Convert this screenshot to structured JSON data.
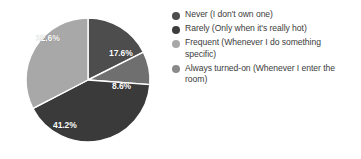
{
  "chart_data": {
    "type": "pie",
    "title": "",
    "legend_position": "right",
    "categories": [
      "Never (I don't own one)",
      "Rarely (Only when it's really hot)",
      "Frequent (Whenever I do something specific)",
      "Always turned-on (Whenever I enter the room)"
    ],
    "values": [
      17.6,
      8.6,
      41.2,
      32.6
    ],
    "value_labels": [
      "17.6%",
      "8.6%",
      "41.2%",
      "32.6%"
    ],
    "unit": "%",
    "colors": [
      "#4d4d4d",
      "#6f6f6f",
      "#a8a8a8",
      "#3a3a3a"
    ],
    "slices": [
      {
        "label": "Never (I don't own one)",
        "value": 17.6,
        "value_label": "17.6%",
        "color": "#4d4d4d",
        "start_angle": 0,
        "end_angle": 63.36,
        "label_x": 109,
        "label_y": 48
      },
      {
        "label": "Rarely (Only when it's really hot)",
        "value": 8.6,
        "value_label": "8.6%",
        "color": "#6f6f6f",
        "start_angle": 63.36,
        "end_angle": 94.32,
        "label_x": 112,
        "label_y": 81
      },
      {
        "label": "Frequent (Whenever I do something specific)",
        "value": 41.2,
        "value_label": "41.2%",
        "color": "#3a3a3a",
        "start_angle": 94.32,
        "end_angle": 242.64,
        "label_x": 53,
        "label_y": 120
      },
      {
        "label": "Always turned-on (Whenever I enter the room)",
        "value": 32.6,
        "value_label": "32.6%",
        "color": "#a8a8a8",
        "start_angle": 242.64,
        "end_angle": 360,
        "label_x": 36,
        "label_y": 33
      }
    ]
  },
  "legend": {
    "items": [
      {
        "label": "Never (I don't own one)",
        "color": "#4d4d4d"
      },
      {
        "label": "Rarely (Only when it's really hot)",
        "color": "#3d3d3d"
      },
      {
        "label": "Frequent (Whenever I do something specific)",
        "color": "#a8a8a8"
      },
      {
        "label": "Always turned-on (Whenever I enter the room)",
        "color": "#8a8a8a"
      }
    ]
  }
}
